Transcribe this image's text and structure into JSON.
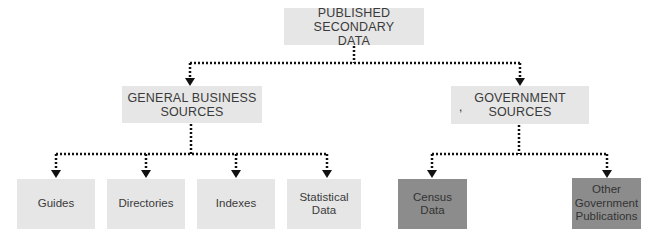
{
  "diagram": {
    "root": {
      "label_line1": "Published Secondary",
      "label_line2": "Data"
    },
    "branches": [
      {
        "label_line1": "General Business",
        "label_line2": "Sources",
        "children": [
          {
            "label": "Guides"
          },
          {
            "label": "Directories"
          },
          {
            "label": "Indexes"
          },
          {
            "label_line1": "Statistical",
            "label_line2": "Data"
          }
        ]
      },
      {
        "label_line1": "Government",
        "label_line2": "Sources",
        "children": [
          {
            "label_line1": "Census",
            "label_line2": "Data"
          },
          {
            "label_line1": "Other",
            "label_line2": "Government",
            "label_line3": "Publications"
          }
        ]
      }
    ],
    "stray_mark": ",",
    "colors": {
      "light_box": "#e6e6e6",
      "dark_box": "#8c8c8c",
      "connector": "#111111"
    }
  }
}
